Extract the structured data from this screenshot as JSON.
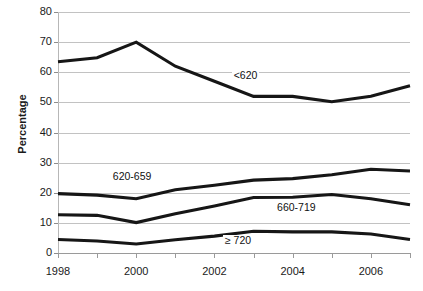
{
  "chart_data": {
    "type": "line",
    "title": "",
    "xlabel": "",
    "ylabel": "Percentage",
    "x": [
      1998,
      1999,
      2000,
      2001,
      2002,
      2003,
      2004,
      2005,
      2006,
      2007
    ],
    "xtick_labels": [
      "1998",
      "2000",
      "2002",
      "2004",
      "2006"
    ],
    "xtick_values": [
      1998,
      2000,
      2002,
      2004,
      2006
    ],
    "ytick_labels": [
      "0",
      "10",
      "20",
      "30",
      "40",
      "50",
      "60",
      "70",
      "80"
    ],
    "ytick_values": [
      0,
      10,
      20,
      30,
      40,
      50,
      60,
      70,
      80
    ],
    "xlim": [
      1998,
      2007
    ],
    "ylim": [
      0,
      80
    ],
    "grid": "horizontal",
    "legend": "inline-labels",
    "series": [
      {
        "name": "<620",
        "label": "<620",
        "color": "#161616",
        "values": [
          63.5,
          64.8,
          70.0,
          62.0,
          57.0,
          52.0,
          52.0,
          50.2,
          52.0,
          55.5
        ]
      },
      {
        "name": "620-659",
        "label": "620-659",
        "color": "#161616",
        "values": [
          19.7,
          19.2,
          18.0,
          21.0,
          22.5,
          24.2,
          24.7,
          26.0,
          27.8,
          27.2
        ]
      },
      {
        "name": "660-719",
        "label": "660-719",
        "color": "#161616",
        "values": [
          12.7,
          12.5,
          10.1,
          13.0,
          15.6,
          18.4,
          18.5,
          19.4,
          18.0,
          16.0
        ]
      },
      {
        "name": "≥ 720",
        "label": "≥ 720",
        "color": "#161616",
        "values": [
          4.5,
          4.0,
          3.0,
          4.4,
          5.6,
          7.2,
          7.0,
          7.0,
          6.3,
          4.5
        ]
      }
    ],
    "annotations": [
      {
        "text": "<620",
        "x": 2002.8,
        "y": 58.5
      },
      {
        "text": "620-659",
        "x": 1999.9,
        "y": 25.0
      },
      {
        "text": "660-719",
        "x": 2004.1,
        "y": 14.5
      },
      {
        "text": "≥ 720",
        "x": 2002.6,
        "y": 3.6
      }
    ]
  },
  "axes": {
    "y_title": "Percentage"
  }
}
